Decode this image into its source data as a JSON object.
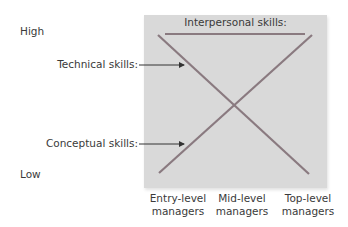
{
  "y_axis": {
    "high_label": "High",
    "low_label": "Low"
  },
  "panel": {
    "title": "Interpersonal skills:"
  },
  "annotations": {
    "technical": "Technical skills:",
    "conceptual": "Conceptual skills:"
  },
  "categories": [
    {
      "line1": "Entry-level",
      "line2": "managers"
    },
    {
      "line1": "Mid-level",
      "line2": "managers"
    },
    {
      "line1": "Top-level",
      "line2": "managers"
    }
  ],
  "colors": {
    "panel_bg": "#d9d9d9",
    "line": "#8a7a80",
    "arrow": "#333333"
  }
}
